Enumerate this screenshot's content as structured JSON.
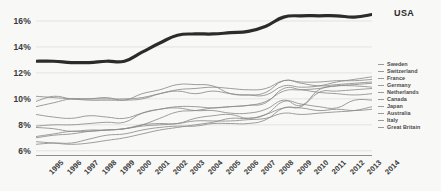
{
  "chart_data": {
    "type": "line",
    "title": "",
    "xlabel": "",
    "ylabel": "",
    "x": [
      1995,
      1996,
      1997,
      1998,
      1999,
      2000,
      2001,
      2002,
      2003,
      2004,
      2005,
      2006,
      2007,
      2008,
      2009,
      2010,
      2011,
      2012,
      2013,
      2014
    ],
    "xlim": [
      1995,
      2014
    ],
    "ylim": [
      5.6,
      17.0
    ],
    "yticks": [
      6,
      8,
      10,
      12,
      14,
      16
    ],
    "ytick_labels": [
      "6%",
      "8%",
      "10%",
      "12%",
      "14%",
      "16%"
    ],
    "xtick_labels": [
      "1995",
      "1996",
      "1997",
      "1998",
      "1999",
      "2000",
      "2001",
      "2002",
      "2003",
      "2004",
      "2005",
      "2006",
      "2007",
      "2008",
      "2009",
      "2010",
      "2011",
      "2012",
      "2013",
      "2014"
    ],
    "grid": true,
    "grid_axis": "y",
    "legend_position": "right",
    "highlight_series": "USA",
    "highlight_color": "#2b2b2b",
    "other_series_color": "#8c8c8c",
    "background_color": "#f8f8f6",
    "series": [
      {
        "name": "USA",
        "highlight": true,
        "values": [
          12.9,
          12.9,
          12.8,
          12.8,
          12.9,
          12.9,
          13.6,
          14.3,
          14.9,
          15.0,
          15.0,
          15.1,
          15.2,
          15.6,
          16.3,
          16.4,
          16.4,
          16.4,
          16.3,
          16.5
        ]
      },
      {
        "name": "Sweden",
        "highlight": false,
        "values": [
          7.9,
          8.0,
          8.0,
          8.1,
          8.2,
          8.2,
          8.9,
          9.2,
          9.3,
          9.1,
          9.1,
          8.9,
          8.9,
          9.2,
          9.9,
          9.5,
          10.7,
          11.0,
          11.1,
          11.2
        ]
      },
      {
        "name": "Switzerland",
        "highlight": false,
        "values": [
          9.4,
          9.7,
          10.0,
          10.0,
          10.1,
          9.9,
          10.4,
          10.7,
          11.1,
          11.1,
          11.0,
          10.4,
          10.3,
          10.3,
          11.0,
          10.9,
          11.0,
          11.3,
          11.5,
          11.7
        ]
      },
      {
        "name": "France",
        "highlight": false,
        "values": [
          10.2,
          10.1,
          10.0,
          9.9,
          9.9,
          9.9,
          10.0,
          10.4,
          10.7,
          10.8,
          10.9,
          10.8,
          10.7,
          10.8,
          11.4,
          11.3,
          11.3,
          11.4,
          11.4,
          11.5
        ]
      },
      {
        "name": "Germany",
        "highlight": false,
        "values": [
          9.8,
          10.2,
          10.0,
          10.0,
          10.0,
          10.0,
          10.1,
          10.4,
          10.6,
          10.4,
          10.6,
          10.4,
          10.3,
          10.5,
          11.4,
          11.2,
          11.0,
          11.1,
          11.2,
          11.3
        ]
      },
      {
        "name": "Netherlands",
        "highlight": false,
        "values": [
          7.8,
          7.7,
          7.5,
          7.6,
          7.6,
          7.7,
          8.0,
          8.5,
          9.0,
          9.1,
          9.3,
          9.4,
          9.5,
          9.8,
          10.6,
          10.7,
          10.8,
          11.0,
          11.0,
          10.9
        ]
      },
      {
        "name": "Canada",
        "highlight": false,
        "values": [
          8.8,
          8.6,
          8.5,
          8.7,
          8.6,
          8.5,
          8.9,
          9.2,
          9.4,
          9.4,
          9.3,
          9.4,
          9.5,
          9.7,
          10.8,
          10.7,
          10.5,
          10.4,
          10.3,
          10.4
        ]
      },
      {
        "name": "Japan",
        "highlight": false,
        "values": [
          6.5,
          6.6,
          6.6,
          6.9,
          7.2,
          7.3,
          7.6,
          7.8,
          7.9,
          7.9,
          8.1,
          8.1,
          8.1,
          8.4,
          9.3,
          9.4,
          10.5,
          10.6,
          10.7,
          10.8
        ]
      },
      {
        "name": "Australia",
        "highlight": false,
        "values": [
          7.0,
          7.2,
          7.3,
          7.5,
          7.6,
          7.7,
          7.9,
          8.0,
          8.1,
          8.3,
          8.3,
          8.3,
          8.4,
          8.5,
          8.9,
          8.8,
          8.9,
          9.0,
          9.1,
          9.4
        ]
      },
      {
        "name": "Italy",
        "highlight": false,
        "values": [
          7.1,
          7.3,
          7.5,
          7.5,
          7.6,
          7.7,
          8.0,
          8.1,
          8.1,
          8.5,
          8.7,
          8.8,
          8.5,
          8.8,
          9.3,
          9.3,
          9.1,
          9.2,
          9.1,
          9.2
        ]
      },
      {
        "name": "Great Britain",
        "highlight": false,
        "values": [
          6.7,
          6.6,
          6.5,
          6.6,
          6.8,
          7.0,
          7.3,
          7.6,
          7.8,
          8.0,
          8.2,
          8.5,
          8.5,
          8.8,
          9.8,
          9.6,
          9.4,
          9.3,
          9.9,
          9.9
        ]
      }
    ]
  },
  "labels": {
    "usa_callout": "USA"
  }
}
